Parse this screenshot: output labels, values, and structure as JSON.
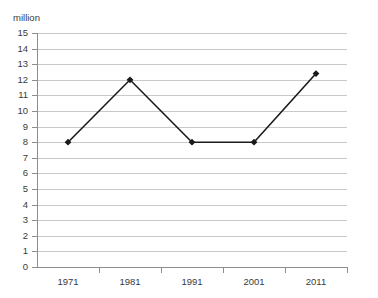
{
  "chart_data": {
    "type": "line",
    "title": "",
    "unit_label": "million",
    "xlabel": "",
    "ylabel": "",
    "categories": [
      "1971",
      "1981",
      "1991",
      "2001",
      "2011"
    ],
    "values": [
      8,
      12,
      8,
      8,
      12.4
    ],
    "series": [
      {
        "name": "",
        "values": [
          8,
          12,
          8,
          8,
          12.4
        ]
      }
    ],
    "ylim": [
      0,
      15
    ],
    "ytick_labels": [
      "15",
      "14",
      "13",
      "12",
      "11",
      "10",
      "9",
      "8",
      "7",
      "6",
      "5",
      "4",
      "3",
      "2",
      "1",
      "0"
    ],
    "ytick_values": [
      15,
      14,
      13,
      12,
      11,
      10,
      9,
      8,
      7,
      6,
      5,
      4,
      3,
      2,
      1,
      0
    ],
    "grid": true,
    "legend": "none",
    "marker": "diamond",
    "colors": {
      "line": "#1a1a1a",
      "marker": "#1a1a1a",
      "grid": "#c9c9c9",
      "axis": "#8d8d8d",
      "text": "#3a3a3a",
      "background": "#ffffff"
    }
  }
}
